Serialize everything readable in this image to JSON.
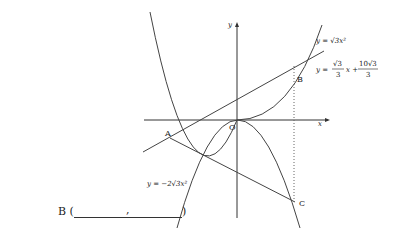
{
  "figure": {
    "axis_x_label": "x",
    "axis_y_label": "y",
    "origin_label": "O",
    "points": {
      "A": "A",
      "B": "B",
      "C": "C"
    },
    "curves": {
      "upper_parabola": "y = √3x²",
      "line": {
        "lhs": "y =",
        "frac1_num": "√3",
        "frac1_den": "3",
        "mid": "x +",
        "frac2_num": "10√3",
        "frac2_den": "3"
      },
      "lower_parabola": "y = −2√3x²"
    }
  },
  "answer": {
    "label": "B (",
    "separator": ",",
    "close": ")"
  }
}
